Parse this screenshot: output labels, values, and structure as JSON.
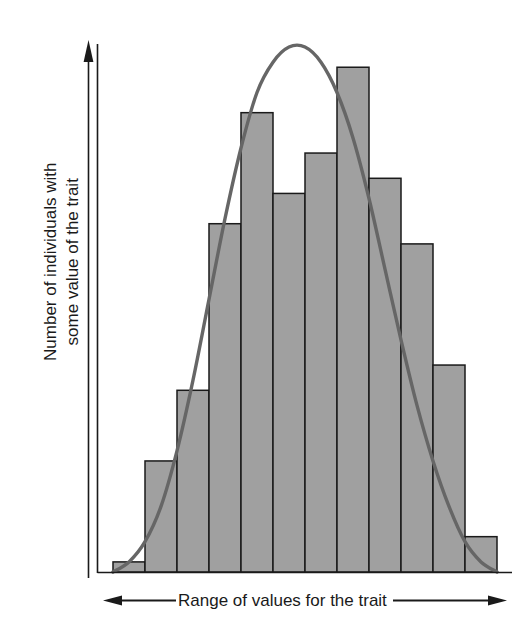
{
  "chart_data": {
    "type": "bar",
    "title": "",
    "subtitle": "",
    "xlabel": "Range of values for the trait",
    "ylabel": "Number of individuals with some value of the trait",
    "ylabel_line1": "Number of individuals with",
    "ylabel_line2": "some value of the trait",
    "categories": [
      "1",
      "2",
      "3",
      "4",
      "5",
      "6",
      "7",
      "8",
      "9",
      "10",
      "11",
      "12"
    ],
    "values": [
      2,
      22,
      36,
      69,
      91,
      75,
      83,
      100,
      78,
      65,
      41,
      7
    ],
    "ylim": [
      0,
      105
    ],
    "xlim": [
      0,
      12
    ],
    "grid": false,
    "legend": null,
    "tick_labels_x": [],
    "tick_labels_y": [],
    "annotations": [
      {
        "name": "normal-distribution-curve",
        "description": "bell-shaped normal distribution curve overlaid on the histogram",
        "peak_value": 104,
        "peak_category_position": 6.0
      }
    ],
    "series": [
      {
        "name": "Number of individuals",
        "type": "bar",
        "values": [
          2,
          22,
          36,
          69,
          91,
          75,
          83,
          100,
          78,
          65,
          41,
          7
        ]
      },
      {
        "name": "Normal curve",
        "type": "line",
        "x": [
          0.0,
          0.5,
          1.0,
          1.5,
          2.0,
          2.5,
          3.0,
          3.5,
          4.0,
          4.5,
          5.0,
          5.5,
          6.0,
          6.5,
          7.0,
          7.5,
          8.0,
          8.5,
          9.0,
          9.5,
          10.0,
          10.5,
          11.0,
          11.5,
          12.0
        ],
        "values": [
          0,
          2,
          6,
          13,
          24,
          38,
          54,
          70,
          84,
          95,
          101,
          104,
          104,
          101,
          95,
          86,
          74,
          60,
          46,
          33,
          22,
          13,
          6,
          2,
          0
        ]
      }
    ]
  },
  "axes": {
    "y_arrow": "upward-arrow",
    "x_arrow_left": "left-arrow",
    "x_arrow_right": "right-arrow"
  },
  "style": {
    "bar_fill": "#a0a0a0",
    "bar_stroke": "#1a1a1a",
    "curve_color": "#666666",
    "axis_color": "#1a1a1a",
    "background": "#ffffff",
    "text_color": "#1a1a1a"
  }
}
